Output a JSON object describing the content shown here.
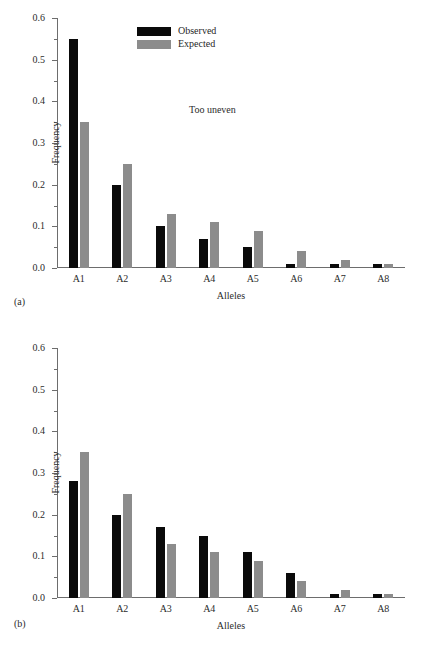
{
  "figure": {
    "background_color": "#ffffff",
    "observed_color": "#0a0a0a",
    "expected_color": "#8c8c8c",
    "axis_color": "#6d6d6d"
  },
  "panels": [
    {
      "caption": "(a)",
      "annotation": "Too uneven",
      "chart_data": {
        "type": "bar",
        "title": "",
        "subtitle": "",
        "annotation": "Too uneven",
        "xlabel": "Alleles",
        "ylabel": "Frequency",
        "categories": [
          "A1",
          "A2",
          "A3",
          "A4",
          "A5",
          "A6",
          "A7",
          "A8"
        ],
        "series": [
          {
            "name": "Observed",
            "color": "#0a0a0a",
            "values": [
              0.55,
              0.2,
              0.1,
              0.07,
              0.05,
              0.01,
              0.01,
              0.01
            ]
          },
          {
            "name": "Expected",
            "color": "#8c8c8c",
            "values": [
              0.35,
              0.25,
              0.13,
              0.11,
              0.09,
              0.04,
              0.02,
              0.01
            ]
          }
        ],
        "ylim": [
          0.0,
          0.6
        ],
        "ytick_labels": [
          "0.0",
          "0.1",
          "0.2",
          "0.3",
          "0.4",
          "0.5",
          "0.6"
        ],
        "ytick_values": [
          0.0,
          0.1,
          0.2,
          0.3,
          0.4,
          0.5,
          0.6
        ],
        "yminor_step": 0.05,
        "grid": false,
        "legend_position": "top-center",
        "legend": [
          "Observed",
          "Expected"
        ]
      }
    },
    {
      "caption": "(b)",
      "annotation": "Too even",
      "chart_data": {
        "type": "bar",
        "title": "",
        "subtitle": "",
        "annotation": "Too even",
        "xlabel": "Alleles",
        "ylabel": "Frequency",
        "categories": [
          "A1",
          "A2",
          "A3",
          "A4",
          "A5",
          "A6",
          "A7",
          "A8"
        ],
        "series": [
          {
            "name": "Observed",
            "color": "#0a0a0a",
            "values": [
              0.28,
              0.2,
              0.17,
              0.15,
              0.11,
              0.06,
              0.01,
              0.01
            ]
          },
          {
            "name": "Expected",
            "color": "#8c8c8c",
            "values": [
              0.35,
              0.25,
              0.13,
              0.11,
              0.09,
              0.04,
              0.02,
              0.01
            ]
          }
        ],
        "ylim": [
          0.0,
          0.6
        ],
        "ytick_labels": [
          "0.0",
          "0.1",
          "0.2",
          "0.3",
          "0.4",
          "0.5",
          "0.6"
        ],
        "ytick_values": [
          0.0,
          0.1,
          0.2,
          0.3,
          0.4,
          0.5,
          0.6
        ],
        "yminor_step": 0.05,
        "grid": false,
        "legend_position": "top-left",
        "legend": [
          "Observed",
          "Expected"
        ]
      }
    }
  ]
}
